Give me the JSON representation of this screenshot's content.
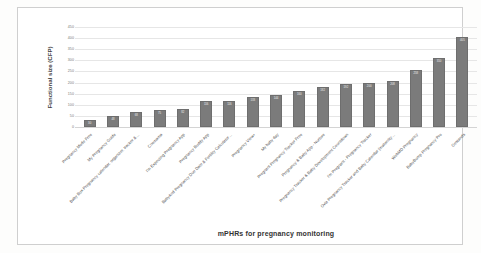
{
  "chart_data": {
    "type": "bar",
    "title": "",
    "xlabel": "mPHRs for pregnancy monitoring",
    "ylabel": "Functional size (CFP)",
    "ylim": [
      0,
      450
    ],
    "yticks": [
      0,
      50,
      100,
      150,
      200,
      250,
      300,
      350,
      400,
      450
    ],
    "grid": true,
    "legend": "none",
    "bar_color": "#7b7b7b",
    "categories": [
      "Pregnancy Mode Free",
      "My Pregnancy Guide",
      "Baby Box Pregnancy calendar, organizer, tracker &…",
      "Cnemama",
      "I'm Expecting Pregnancy App",
      "Pregnancy Buddy App",
      "BabyAnd Pregnancy Due Date & Fertility Calculator…",
      "Pregnancy View+",
      "My baby day",
      "Pregnant Pregnancy Tracker Free",
      "Pregnancy & Baby App - Nurture",
      "Pregnancy Tracker & Baby Development Countdown",
      "I'm Pregnant - Pregnancy Tracker",
      "Ovia Pregnancy Tracker and Baby Calendar (maternity…",
      "WebMD Pregnancy",
      "BabyBump Pregnancy Pro",
      "Gestands"
    ],
    "values": [
      30,
      48,
      68,
      75,
      82,
      116,
      116,
      133,
      144,
      160,
      182,
      192,
      200,
      208,
      258,
      310,
      405
    ]
  }
}
